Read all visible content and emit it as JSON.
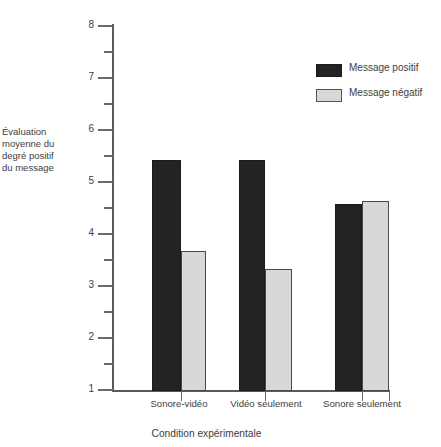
{
  "chart_data": {
    "type": "bar",
    "title": "",
    "xlabel": "Condition expérimentale",
    "ylabel": "Évaluation\nmoyenne du\ndegré positif\ndu message",
    "categories": [
      "Sonore-vidéo",
      "Vidéo seulement",
      "Sonore seulement"
    ],
    "series": [
      {
        "name": "Message positif",
        "color": "#232323",
        "values": [
          5.44,
          5.44,
          4.6
        ]
      },
      {
        "name": "Message négatif",
        "color": "#d8d8d8",
        "values": [
          3.69,
          3.34,
          4.65
        ]
      }
    ],
    "ylim": [
      1,
      8
    ],
    "y_major_ticks": [
      1,
      2,
      3,
      4,
      5,
      6,
      7,
      8
    ],
    "y_major_tick_labels": [
      "1",
      "2",
      "3",
      "4",
      "5",
      "6",
      "7",
      "8"
    ],
    "y_minor_ticks": [
      1.5,
      2.5,
      3.5,
      4.5,
      5.5,
      6.5,
      7.5
    ],
    "grid": false,
    "legend_position": "top-right"
  },
  "legend": {
    "entries": [
      {
        "label": "Message positif",
        "swatch": "pos"
      },
      {
        "label": "Message négatif",
        "swatch": "neg"
      }
    ]
  },
  "axes": {
    "y_title": "Évaluation\nmoyenne du\ndegré positif\ndu message",
    "x_title": "Condition expérimentale"
  }
}
